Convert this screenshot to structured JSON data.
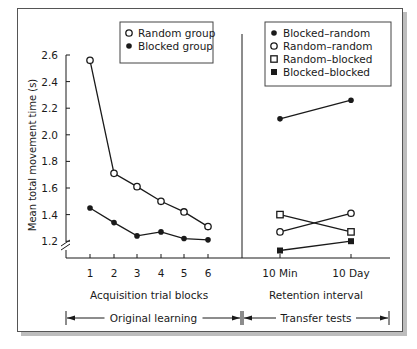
{
  "chart_data": [
    {
      "type": "line",
      "panel": "left",
      "title": "",
      "xlabel": "Acquisition trial blocks",
      "ylabel": "Mean total movement time (s)",
      "categories": [
        "1",
        "2",
        "3",
        "4",
        "5",
        "6"
      ],
      "ylim": [
        1.0,
        2.6
      ],
      "yticks": [
        "2.6",
        "2.4",
        "2.2",
        "2.0",
        "1.8",
        "1.6",
        "1.4",
        "1.2"
      ],
      "axis_break": true,
      "grid": false,
      "legend_position": "top-right",
      "series": [
        {
          "name": "Random group",
          "marker": "open-circle",
          "values": [
            2.56,
            1.71,
            1.61,
            1.5,
            1.42,
            1.31
          ]
        },
        {
          "name": "Blocked group",
          "marker": "filled-circle",
          "values": [
            1.45,
            1.34,
            1.24,
            1.27,
            1.22,
            1.21
          ]
        }
      ],
      "span_label": "Original learning"
    },
    {
      "type": "line",
      "panel": "right",
      "title": "",
      "xlabel": "Retention interval",
      "ylabel": "",
      "categories": [
        "10 Min",
        "10 Day"
      ],
      "ylim": [
        1.0,
        2.6
      ],
      "grid": false,
      "legend_position": "top-right",
      "series": [
        {
          "name": "Blocked–random",
          "marker": "filled-circle",
          "values": [
            2.12,
            2.26
          ]
        },
        {
          "name": "Random–random",
          "marker": "open-circle",
          "values": [
            1.27,
            1.41
          ]
        },
        {
          "name": "Random–blocked",
          "marker": "open-square",
          "values": [
            1.4,
            1.27
          ]
        },
        {
          "name": "Blocked–blocked",
          "marker": "filled-square",
          "values": [
            1.13,
            1.2
          ]
        }
      ],
      "span_label": "Transfer tests"
    }
  ],
  "labels": {
    "ylabel": "Mean total movement time (s)",
    "left_xlabel": "Acquisition trial blocks",
    "right_xlabel": "Retention interval",
    "left_span": "Original learning",
    "right_span": "Transfer tests"
  },
  "colors": {
    "ink": "#1a1a1a",
    "frame": "#555555",
    "shadow": "#bdbdbd"
  }
}
